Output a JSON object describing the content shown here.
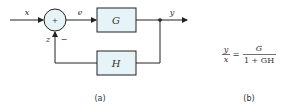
{
  "diagram": {
    "panel_a": {
      "caption": "(a)",
      "signals": {
        "input": "x",
        "error": "e",
        "output": "y",
        "feedback": "z"
      },
      "summing_junction": {
        "symbol": "+",
        "feedback_sign": "−"
      },
      "blocks": {
        "forward": "G",
        "feedback": "H"
      }
    },
    "panel_b": {
      "caption": "(b)",
      "lhs_num": "y",
      "lhs_den": "x",
      "equals": "=",
      "rhs_num": "G",
      "rhs_den": "1 + GH"
    },
    "colors": {
      "block_fill": "#e6f3f7",
      "stroke": "#333333"
    }
  }
}
